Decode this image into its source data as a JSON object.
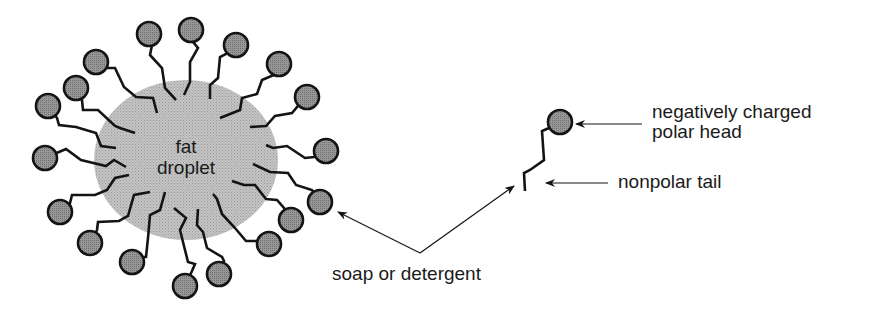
{
  "colors": {
    "background": "#ffffff",
    "droplet_fill": "#bdbdbd",
    "head_fill": "#8f8f8f",
    "stroke": "#141414",
    "text": "#1a1a1a"
  },
  "droplet": {
    "label_line1": "fat",
    "label_line2": "droplet",
    "cx": 186,
    "cy": 160,
    "rx": 92,
    "ry": 80
  },
  "micelle_molecules": [
    {
      "head": [
        149,
        34
      ],
      "tail": [
        [
          152,
          45
        ],
        [
          150,
          55
        ],
        [
          162,
          68
        ],
        [
          165,
          88
        ],
        [
          176,
          100
        ]
      ]
    },
    {
      "head": [
        191,
        30
      ],
      "tail": [
        [
          193,
          42
        ],
        [
          198,
          48
        ],
        [
          190,
          62
        ],
        [
          190,
          82
        ],
        [
          184,
          95
        ]
      ]
    },
    {
      "head": [
        236,
        45
      ],
      "tail": [
        [
          226,
          54
        ],
        [
          220,
          57
        ],
        [
          218,
          78
        ],
        [
          210,
          85
        ],
        [
          210,
          99
        ]
      ]
    },
    {
      "head": [
        279,
        64
      ],
      "tail": [
        [
          276,
          74
        ],
        [
          262,
          80
        ],
        [
          257,
          94
        ],
        [
          242,
          98
        ],
        [
          240,
          110
        ],
        [
          220,
          118
        ]
      ]
    },
    {
      "head": [
        307,
        97
      ],
      "tail": [
        [
          298,
          106
        ],
        [
          292,
          113
        ],
        [
          275,
          116
        ],
        [
          266,
          126
        ],
        [
          250,
          127
        ]
      ]
    },
    {
      "head": [
        326,
        151
      ],
      "tail": [
        [
          314,
          157
        ],
        [
          305,
          158
        ],
        [
          287,
          146
        ],
        [
          273,
          148
        ],
        [
          266,
          145
        ]
      ]
    },
    {
      "head": [
        320,
        202
      ],
      "tail": [
        [
          312,
          190
        ],
        [
          296,
          185
        ],
        [
          288,
          173
        ],
        [
          270,
          172
        ],
        [
          253,
          164
        ]
      ]
    },
    {
      "head": [
        291,
        220
      ],
      "tail": [
        [
          284,
          208
        ],
        [
          277,
          200
        ],
        [
          266,
          199
        ],
        [
          255,
          185
        ],
        [
          244,
          185
        ],
        [
          232,
          181
        ]
      ]
    },
    {
      "head": [
        269,
        244
      ],
      "tail": [
        [
          257,
          241
        ],
        [
          246,
          241
        ],
        [
          235,
          228
        ],
        [
          222,
          214
        ],
        [
          217,
          199
        ],
        [
          213,
          194
        ]
      ]
    },
    {
      "head": [
        219,
        274
      ],
      "tail": [
        [
          224,
          261
        ],
        [
          222,
          257
        ],
        [
          207,
          248
        ],
        [
          203,
          232
        ],
        [
          197,
          225
        ],
        [
          198,
          209
        ]
      ]
    },
    {
      "head": [
        185,
        286
      ],
      "tail": [
        [
          192,
          271
        ],
        [
          195,
          264
        ],
        [
          188,
          262
        ],
        [
          180,
          230
        ],
        [
          186,
          218
        ],
        [
          174,
          208
        ]
      ]
    },
    {
      "head": [
        132,
        262
      ],
      "tail": [
        [
          144,
          257
        ],
        [
          146,
          257
        ],
        [
          148,
          238
        ],
        [
          150,
          215
        ],
        [
          160,
          210
        ],
        [
          165,
          192
        ]
      ]
    },
    {
      "head": [
        90,
        243
      ],
      "tail": [
        [
          97,
          230
        ],
        [
          98,
          222
        ],
        [
          119,
          221
        ],
        [
          128,
          216
        ],
        [
          134,
          195
        ],
        [
          150,
          192
        ]
      ]
    },
    {
      "head": [
        60,
        212
      ],
      "tail": [
        [
          70,
          203
        ],
        [
          72,
          195
        ],
        [
          95,
          195
        ],
        [
          107,
          190
        ],
        [
          115,
          178
        ],
        [
          129,
          175
        ]
      ]
    },
    {
      "head": [
        45,
        158
      ],
      "tail": [
        [
          59,
          152
        ],
        [
          66,
          149
        ],
        [
          81,
          160
        ],
        [
          106,
          166
        ],
        [
          114,
          160
        ],
        [
          126,
          167
        ]
      ]
    },
    {
      "head": [
        48,
        106
      ],
      "tail": [
        [
          57,
          118
        ],
        [
          59,
          125
        ],
        [
          76,
          127
        ],
        [
          96,
          133
        ],
        [
          101,
          146
        ],
        [
          116,
          148
        ]
      ]
    },
    {
      "head": [
        76,
        88
      ],
      "tail": [
        [
          82,
          100
        ],
        [
          83,
          110
        ],
        [
          98,
          110
        ],
        [
          115,
          126
        ],
        [
          120,
          128
        ],
        [
          135,
          133
        ]
      ]
    },
    {
      "head": [
        96,
        62
      ],
      "tail": [
        [
          106,
          68
        ],
        [
          115,
          68
        ],
        [
          124,
          87
        ],
        [
          136,
          97
        ],
        [
          153,
          98
        ],
        [
          157,
          113
        ]
      ]
    }
  ],
  "head_radius": 12,
  "single_molecule": {
    "head": [
      560,
      122
    ],
    "tail": [
      [
        549,
        128
      ],
      [
        542,
        131
      ],
      [
        544,
        160
      ],
      [
        530,
        170
      ],
      [
        524,
        173
      ],
      [
        525,
        191
      ]
    ]
  },
  "labels": {
    "head_line1": "negatively charged",
    "head_line2": "polar head",
    "tail": "nonpolar tail",
    "soap": "soap or detergent"
  },
  "arrows": [
    {
      "name": "head-arrow",
      "from": [
        642,
        124
      ],
      "to": [
        576,
        124
      ]
    },
    {
      "name": "tail-arrow",
      "from": [
        608,
        183
      ],
      "to": [
        546,
        183
      ]
    },
    {
      "name": "soap-arrow-left",
      "from": [
        420,
        253
      ],
      "to": [
        338,
        212
      ]
    },
    {
      "name": "soap-arrow-right",
      "from": [
        420,
        253
      ],
      "to": [
        514,
        186
      ]
    }
  ]
}
